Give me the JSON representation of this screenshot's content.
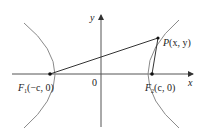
{
  "diagram": {
    "axes": {
      "x_label": "x",
      "y_label": "y",
      "origin_label": "0"
    },
    "foci": [
      {
        "name": "F1",
        "label_main": "F",
        "label_sub": "1",
        "label_coords": "(−c, 0)"
      },
      {
        "name": "F2",
        "label_main": "F",
        "label_sub": "2",
        "label_coords": "(c, 0)"
      }
    ],
    "point": {
      "label_main": "P",
      "label_coords": "(x, y)"
    },
    "colors": {
      "axis": "#333333",
      "curve": "#8a8a8a",
      "line": "#333333"
    }
  }
}
